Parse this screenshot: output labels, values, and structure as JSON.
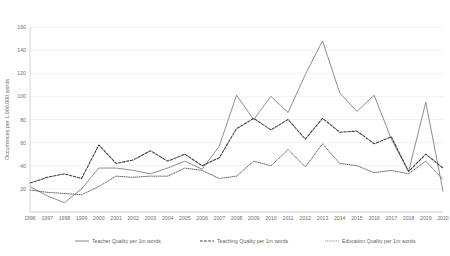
{
  "chart_data": {
    "type": "line",
    "title": "",
    "xlabel": "",
    "ylabel": "Occurrences per 1,000,000 words",
    "ylim": [
      0,
      160
    ],
    "yticks": [
      0,
      20,
      40,
      60,
      80,
      100,
      120,
      140,
      160
    ],
    "grid": true,
    "legend_position": "bottom",
    "categories": [
      "1996",
      "1997",
      "1998",
      "1999",
      "2000",
      "2001",
      "2002",
      "2003",
      "2004",
      "2005",
      "2006",
      "2007",
      "2008",
      "2009",
      "2010",
      "2011",
      "2012",
      "2013",
      "2014",
      "2015",
      "2016",
      "2017",
      "2018",
      "2019",
      "2020"
    ],
    "series": [
      {
        "name": "Teacher Quality per 1m words",
        "style": "solid",
        "color": "#7a7a7a",
        "values": [
          22,
          14,
          8,
          20,
          38,
          38,
          36,
          33,
          38,
          44,
          37,
          57,
          101,
          80,
          100,
          86,
          119,
          148,
          103,
          87,
          101,
          63,
          35,
          95,
          18
        ]
      },
      {
        "name": "Teaching Quality per 1m words",
        "style": "dashed",
        "color": "#3a3a3a",
        "values": [
          25,
          30,
          33,
          29,
          58,
          42,
          45,
          53,
          44,
          50,
          40,
          47,
          72,
          81,
          71,
          80,
          63,
          81,
          69,
          70,
          59,
          65,
          35,
          50,
          38
        ]
      },
      {
        "name": "Education Quality per 1m words",
        "style": "dotted",
        "color": "#4a4a4a",
        "values": [
          19,
          17,
          16,
          15,
          22,
          31,
          30,
          31,
          31,
          38,
          36,
          29,
          31,
          44,
          40,
          54,
          39,
          59,
          42,
          40,
          34,
          36,
          33,
          44,
          28
        ]
      }
    ]
  },
  "legend": {
    "items": [
      {
        "label": "Teacher Quality per 1m words",
        "style": "solid"
      },
      {
        "label": "Teaching Quality per 1m words",
        "style": "dashed"
      },
      {
        "label": "Education Quality per 1m words",
        "style": "dotted"
      }
    ]
  }
}
